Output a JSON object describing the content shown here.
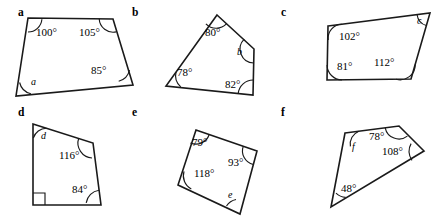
{
  "page": {
    "degree_symbol": "°",
    "stroke_color": "#1a1a1a",
    "background_color": "#ffffff"
  },
  "items": [
    {
      "letter": "a",
      "letter_pos": {
        "x": 18,
        "y": 16
      },
      "vertices": [
        {
          "x": 28,
          "y": 18
        },
        {
          "x": 113,
          "y": 19
        },
        {
          "x": 133,
          "y": 85
        },
        {
          "x": 16,
          "y": 96
        }
      ],
      "angles": [
        {
          "name": "angle-100",
          "label": "100°",
          "known": true,
          "x": 36,
          "y": 36,
          "vertex": 0
        },
        {
          "name": "angle-105",
          "label": "105°",
          "known": true,
          "x": 79,
          "y": 36,
          "vertex": 1
        },
        {
          "name": "angle-85",
          "label": "85°",
          "known": true,
          "x": 91,
          "y": 74,
          "vertex": 2
        },
        {
          "name": "angle-a",
          "label": "a",
          "known": false,
          "x": 31,
          "y": 85,
          "vertex": 3
        }
      ]
    },
    {
      "letter": "b",
      "letter_pos": {
        "x": 132,
        "y": 16
      },
      "vertices": [
        {
          "x": 217,
          "y": 15
        },
        {
          "x": 254,
          "y": 49
        },
        {
          "x": 253,
          "y": 95
        },
        {
          "x": 166,
          "y": 86
        }
      ],
      "angles": [
        {
          "name": "angle-80",
          "label": "80°",
          "known": true,
          "x": 205,
          "y": 36,
          "vertex": 0
        },
        {
          "name": "angle-b",
          "label": "b",
          "known": false,
          "x": 237,
          "y": 55,
          "vertex": 1
        },
        {
          "name": "angle-82",
          "label": "82°",
          "known": true,
          "x": 225,
          "y": 88,
          "vertex": 2
        },
        {
          "name": "angle-78",
          "label": "78°",
          "known": true,
          "x": 177,
          "y": 76,
          "vertex": 3
        }
      ]
    },
    {
      "letter": "c",
      "letter_pos": {
        "x": 281,
        "y": 16
      },
      "vertices": [
        {
          "x": 328,
          "y": 26
        },
        {
          "x": 430,
          "y": 13
        },
        {
          "x": 411,
          "y": 79
        },
        {
          "x": 327,
          "y": 80
        }
      ],
      "angles": [
        {
          "name": "angle-102",
          "label": "102°",
          "known": true,
          "x": 339,
          "y": 40,
          "vertex": 0
        },
        {
          "name": "angle-c",
          "label": "c",
          "known": false,
          "x": 417,
          "y": 24,
          "vertex": 1
        },
        {
          "name": "angle-112",
          "label": "112°",
          "known": true,
          "x": 374,
          "y": 66,
          "vertex": 2
        },
        {
          "name": "angle-81",
          "label": "81°",
          "known": true,
          "x": 337,
          "y": 70,
          "vertex": 3
        }
      ]
    },
    {
      "letter": "d",
      "letter_pos": {
        "x": 18,
        "y": 116
      },
      "vertices": [
        {
          "x": 33,
          "y": 124
        },
        {
          "x": 93,
          "y": 143
        },
        {
          "x": 101,
          "y": 205
        },
        {
          "x": 33,
          "y": 205
        }
      ],
      "angles": [
        {
          "name": "angle-d",
          "label": "d",
          "known": false,
          "x": 41,
          "y": 139,
          "vertex": 0
        },
        {
          "name": "angle-116",
          "label": "116°",
          "known": true,
          "x": 59,
          "y": 159,
          "vertex": 1
        },
        {
          "name": "angle-84",
          "label": "84°",
          "known": true,
          "x": 72,
          "y": 193,
          "vertex": 2
        },
        {
          "name": "angle-right",
          "label": "",
          "known": true,
          "x": 0,
          "y": 0,
          "vertex": 3
        }
      ]
    },
    {
      "letter": "e",
      "letter_pos": {
        "x": 132,
        "y": 116
      },
      "vertices": [
        {
          "x": 196,
          "y": 130
        },
        {
          "x": 257,
          "y": 151
        },
        {
          "x": 240,
          "y": 214
        },
        {
          "x": 178,
          "y": 185
        }
      ],
      "angles": [
        {
          "name": "angle-79",
          "label": "79°",
          "known": true,
          "x": 192,
          "y": 146
        },
        {
          "name": "angle-93",
          "label": "93°",
          "known": true,
          "x": 228,
          "y": 166
        },
        {
          "name": "angle-e",
          "label": "e",
          "known": false,
          "x": 228,
          "y": 198
        },
        {
          "name": "angle-118",
          "label": "118°",
          "known": true,
          "x": 194,
          "y": 177
        }
      ]
    },
    {
      "letter": "f",
      "letter_pos": {
        "x": 281,
        "y": 116
      },
      "vertices": [
        {
          "x": 345,
          "y": 133
        },
        {
          "x": 399,
          "y": 126
        },
        {
          "x": 424,
          "y": 151
        },
        {
          "x": 331,
          "y": 207
        }
      ],
      "angles": [
        {
          "name": "angle-f",
          "label": "f",
          "known": false,
          "x": 352,
          "y": 150
        },
        {
          "name": "angle-78",
          "label": "78°",
          "known": true,
          "x": 369,
          "y": 140
        },
        {
          "name": "angle-108",
          "label": "108°",
          "known": true,
          "x": 382,
          "y": 155
        },
        {
          "name": "angle-48",
          "label": "48°",
          "known": true,
          "x": 341,
          "y": 192
        }
      ]
    }
  ]
}
